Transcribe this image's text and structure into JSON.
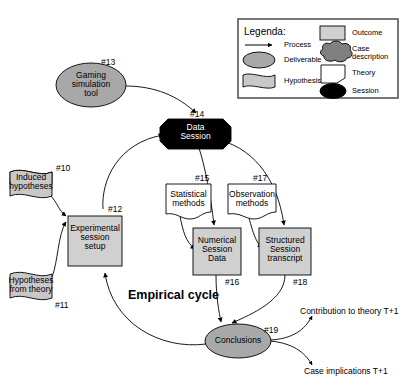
{
  "diagram": {
    "title": "Empirical cycle",
    "legend": {
      "heading": "Legenda:",
      "items": [
        {
          "key": "process",
          "label": "Process",
          "shape": "arrow",
          "fill": "#ffffff"
        },
        {
          "key": "deliverable",
          "label": "Deliverable",
          "shape": "ellipse",
          "fill": "#a8a8a8"
        },
        {
          "key": "hypothesis",
          "label": "Hypothesis",
          "shape": "flag",
          "fill": "#c8c8c8"
        },
        {
          "key": "outcome",
          "label": "Outcome",
          "shape": "rect",
          "fill": "#d0d0d0"
        },
        {
          "key": "case-description",
          "label": "Case\ndescription",
          "shape": "cloud",
          "fill": "#808080"
        },
        {
          "key": "theory",
          "label": "Theory",
          "shape": "note",
          "fill": "#ffffff"
        },
        {
          "key": "session",
          "label": "Session",
          "shape": "octagon",
          "fill": "#000000"
        }
      ]
    },
    "nodes": [
      {
        "id": "n13",
        "tag": "#13",
        "label": "Gaming\nsimulation\ntool",
        "shape": "ellipse",
        "fill": "#a8a8a8",
        "text_color": "#000000"
      },
      {
        "id": "n14",
        "tag": "#14",
        "label": "Data\nSession",
        "shape": "octagon",
        "fill": "#000000",
        "text_color": "#ffffff"
      },
      {
        "id": "n10",
        "tag": "#10",
        "label": "Induced\nhypotheses",
        "shape": "flag",
        "fill": "#c8c8c8",
        "text_color": "#000000"
      },
      {
        "id": "n11",
        "tag": "#11",
        "label": "Hypotheses\nfrom theory",
        "shape": "flag",
        "fill": "#c8c8c8",
        "text_color": "#000000"
      },
      {
        "id": "n12",
        "tag": "#12",
        "label": "Experimental\nsession\nsetup",
        "shape": "rect",
        "fill": "#d0d0d0",
        "text_color": "#000000"
      },
      {
        "id": "n15",
        "tag": "#15",
        "label": "Statistical\nmethods",
        "shape": "note",
        "fill": "#ffffff",
        "text_color": "#000000"
      },
      {
        "id": "n17",
        "tag": "#17",
        "label": "Observation\nmethods",
        "shape": "note",
        "fill": "#ffffff",
        "text_color": "#000000"
      },
      {
        "id": "n16",
        "tag": "#16",
        "label": "Numerical\nSession\nData",
        "shape": "rect",
        "fill": "#d0d0d0",
        "text_color": "#000000"
      },
      {
        "id": "n18",
        "tag": "#18",
        "label": "Structured\nSession\ntranscript",
        "shape": "rect",
        "fill": "#d0d0d0",
        "text_color": "#000000"
      },
      {
        "id": "n19",
        "tag": "#19",
        "label": "Conclusions",
        "shape": "ellipse",
        "fill": "#a8a8a8",
        "text_color": "#000000"
      }
    ],
    "outputs": [
      {
        "id": "out_theory",
        "label": "Contribution to theory T+1"
      },
      {
        "id": "out_case",
        "label": "Case implications T+1"
      }
    ],
    "edges": [
      {
        "from": "n13",
        "to": "n14"
      },
      {
        "from": "n10",
        "to": "n12"
      },
      {
        "from": "n11",
        "to": "n12"
      },
      {
        "from": "n12",
        "to": "n14"
      },
      {
        "from": "n14",
        "to": "n16"
      },
      {
        "from": "n14",
        "to": "n18"
      },
      {
        "from": "n15",
        "to": "n16"
      },
      {
        "from": "n17",
        "to": "n18"
      },
      {
        "from": "n16",
        "to": "n19"
      },
      {
        "from": "n18",
        "to": "n19"
      },
      {
        "from": "n19",
        "to": "n12"
      },
      {
        "from": "n19",
        "to": "out_theory"
      },
      {
        "from": "n19",
        "to": "out_case"
      }
    ]
  }
}
